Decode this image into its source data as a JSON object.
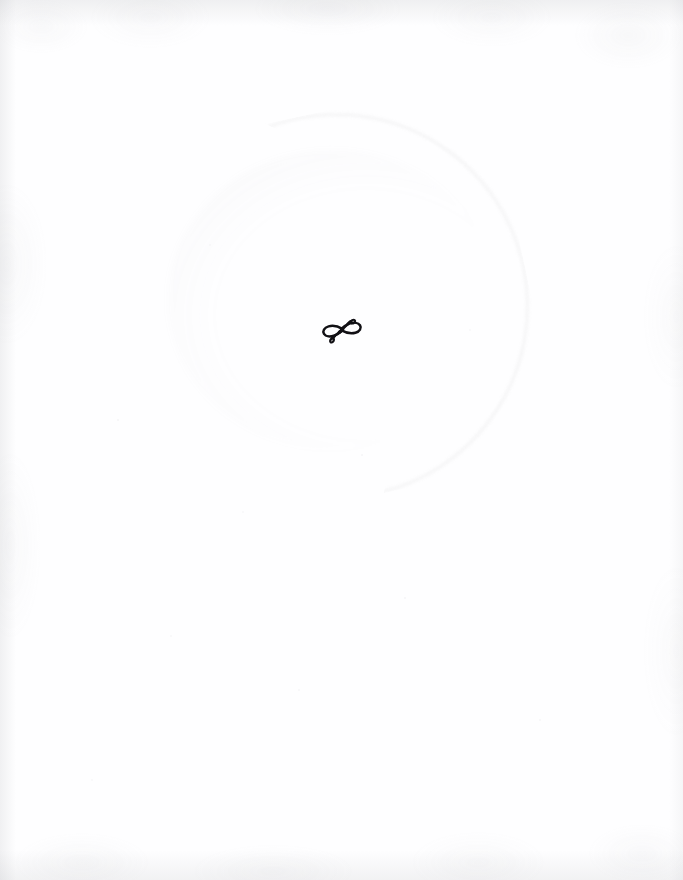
{
  "page": {
    "kind": "scanned-book-page",
    "width": 683,
    "height": 880,
    "background_color": "#fefeff",
    "paper_tone": "#fefefe",
    "edge_shadow_color": "#8c8e94",
    "body_text": "",
    "header_text": "",
    "footer_text": "",
    "page_number": "",
    "running_head": ""
  },
  "ornament": {
    "name": "typographic-fleuron",
    "style": "horizontal double-loop flourish with crossed swash tails",
    "unicode_fallback": "∞",
    "ink_color": "#111014",
    "center_x": 334,
    "center_y": 331,
    "width": 44,
    "height": 27,
    "label": ""
  },
  "artifacts": {
    "ring_stain": {
      "name": "faint-circular-stain",
      "visible": true,
      "color": "#94929c",
      "opacity": "0.085",
      "center_x": 333,
      "center_y": 303,
      "radius": 190
    },
    "paper_grain": {
      "name": "scan-grain-texture",
      "visible": true,
      "color": "#96989e"
    },
    "speckles": {
      "name": "scan-speckles",
      "visible": true,
      "color": "#96969e",
      "count": 10
    }
  }
}
